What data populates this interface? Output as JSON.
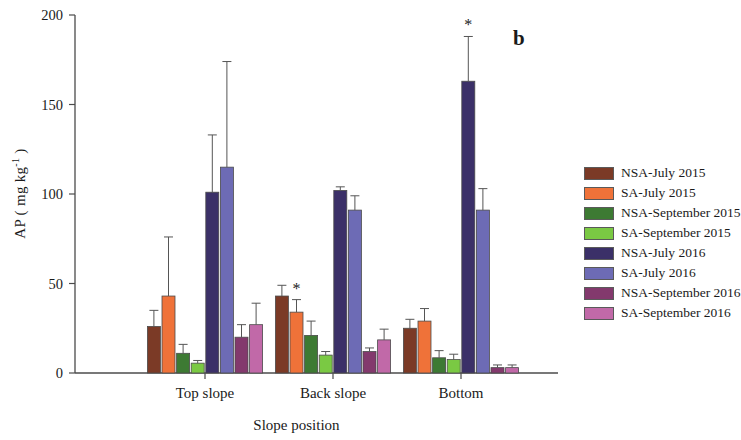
{
  "panel_letter": "b",
  "axes": {
    "y_label": "AP ( mg kg",
    "y_label_sup": "-1",
    "y_label_close": " )",
    "x_label": "Slope position",
    "y_ticks": [
      "0",
      "50",
      "100",
      "150",
      "200"
    ],
    "x_ticks": [
      "Top slope",
      "Back slope",
      "Bottom"
    ]
  },
  "legend": {
    "items": [
      {
        "label": "NSA-July 2015",
        "color": "#7b3a26"
      },
      {
        "label": "SA-July 2015",
        "color": "#ef7239"
      },
      {
        "label": "NSA-September 2015",
        "color": "#3d7a33"
      },
      {
        "label": "SA-September 2015",
        "color": "#7ac943"
      },
      {
        "label": "NSA-July 2016",
        "color": "#3b3068"
      },
      {
        "label": "SA-July 2016",
        "color": "#6d6bb5"
      },
      {
        "label": "NSA-September 2016",
        "color": "#83396d"
      },
      {
        "label": "SA-September 2016",
        "color": "#c169a8"
      }
    ]
  },
  "annotations": [
    {
      "text": "*",
      "group": "Back slope",
      "series": "SA-July 2015"
    },
    {
      "text": "*",
      "group": "Bottom",
      "series": "NSA-July 2016"
    }
  ],
  "chart_data": {
    "type": "bar",
    "title": "",
    "panel": "b",
    "xlabel": "Slope position",
    "ylabel": "AP ( mg kg-1 )",
    "ylim": [
      0,
      200
    ],
    "yticks": [
      0,
      50,
      100,
      150,
      200
    ],
    "grid": false,
    "legend_position": "right",
    "categories": [
      "Top slope",
      "Back slope",
      "Bottom"
    ],
    "series": [
      {
        "name": "NSA-July 2015",
        "color": "#7b3a26",
        "values": [
          26,
          43,
          25
        ],
        "errors": [
          9,
          6,
          5
        ]
      },
      {
        "name": "SA-July 2015",
        "color": "#ef7239",
        "values": [
          43,
          34,
          29
        ],
        "errors": [
          33,
          7,
          7
        ]
      },
      {
        "name": "NSA-September 2015",
        "color": "#3d7a33",
        "values": [
          11,
          21,
          8.5
        ],
        "errors": [
          5,
          8,
          4
        ]
      },
      {
        "name": "SA-September 2015",
        "color": "#7ac943",
        "values": [
          5.5,
          10,
          7.5
        ],
        "errors": [
          1.5,
          2,
          3
        ]
      },
      {
        "name": "NSA-July 2016",
        "color": "#3b3068",
        "values": [
          101,
          102,
          163
        ],
        "errors": [
          32,
          2,
          25
        ]
      },
      {
        "name": "SA-July 2016",
        "color": "#6d6bb5",
        "values": [
          115,
          91,
          91
        ],
        "errors": [
          59,
          8,
          12
        ]
      },
      {
        "name": "NSA-September 2016",
        "color": "#83396d",
        "values": [
          20,
          12,
          3
        ],
        "errors": [
          7,
          2,
          1.5
        ]
      },
      {
        "name": "SA-September 2016",
        "color": "#c169a8",
        "values": [
          27,
          18.5,
          3
        ],
        "errors": [
          12,
          6,
          1.5
        ]
      }
    ]
  }
}
